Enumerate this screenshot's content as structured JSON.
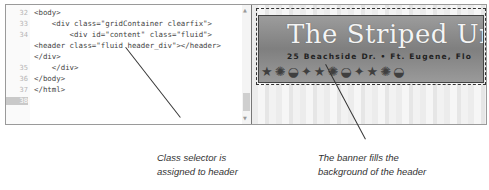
{
  "code_editor": {
    "lines": [
      {
        "num": "32",
        "text": "<body>",
        "indent": 0
      },
      {
        "num": "33",
        "text": "    <div class=\"gridContainer clearfix\">",
        "indent": 0
      },
      {
        "num": "34",
        "text": "        <div id=\"content\" class=\"fluid\">",
        "indent": 0
      },
      {
        "num": "",
        "text": "<header class=\"fluid header_div\"></header>",
        "indent": 0
      },
      {
        "num": "",
        "text": "</div>",
        "indent": 0
      },
      {
        "num": "35",
        "text": "    </div>",
        "indent": 0
      },
      {
        "num": "36",
        "text": "</body>",
        "indent": 0
      },
      {
        "num": "37",
        "text": "</html>",
        "indent": 0
      },
      {
        "num": "38",
        "text": "",
        "indent": 0,
        "current": true
      }
    ]
  },
  "preview": {
    "banner_title": "The Striped Uml",
    "banner_address": "25 Beachside Dr. • Ft. Eugene, Flo",
    "shells": "★✺◒✦★✺◒✦★✺◒"
  },
  "callouts": [
    {
      "line1": "Class selector is",
      "line2": "assigned to header"
    },
    {
      "line1": "The banner fills the",
      "line2": "background of the header"
    }
  ]
}
